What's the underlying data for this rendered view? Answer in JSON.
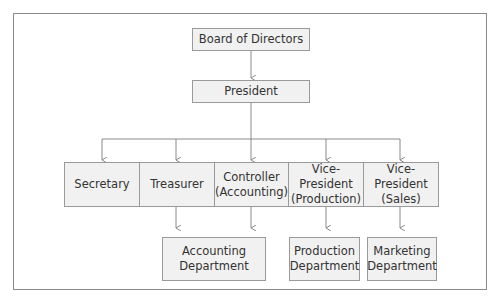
{
  "chart": {
    "top": {
      "board": "Board of Directors",
      "president": "President"
    },
    "officers": [
      "Secretary",
      "Treasurer",
      "Controller\n(Accounting)",
      "Vice-President\n(Production)",
      "Vice-President\n(Sales)"
    ],
    "departments": [
      "Accounting\nDepartment",
      "Production\nDepartment",
      "Marketing\nDepartment"
    ]
  },
  "colors": {
    "box_fill": "#f1f1f1",
    "box_border": "#9a9a9a",
    "line": "#8a8a8a"
  }
}
